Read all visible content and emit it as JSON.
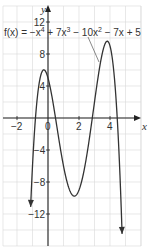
{
  "chart_data": {
    "type": "line",
    "title": "",
    "function_label": "f(x) = −x⁴ + 7x³ − 10x² − 7x + 5",
    "function_label_parts": {
      "fx": "f(x) = −x",
      "e1": "4",
      "p2": " + 7x",
      "e2": "3",
      "p3": " − 10x",
      "e3": "2",
      "p4": " − 7x + 5"
    },
    "xlabel": "x",
    "ylabel": "y",
    "xlim": [
      -3,
      6
    ],
    "ylim": [
      -16,
      14
    ],
    "x_ticks": [
      {
        "v": -2,
        "label": "−2"
      },
      {
        "v": 0,
        "label": "0"
      },
      {
        "v": 2,
        "label": "2"
      },
      {
        "v": 4,
        "label": "4"
      }
    ],
    "y_ticks": [
      {
        "v": 12,
        "label": "12"
      },
      {
        "v": 8,
        "label": "8"
      },
      {
        "v": 4,
        "label": "4"
      },
      {
        "v": -4,
        "label": "−4"
      },
      {
        "v": -8,
        "label": "−8"
      },
      {
        "v": -12,
        "label": "−12"
      }
    ],
    "grid": true,
    "coefficients": [
      -1,
      7,
      -10,
      -7,
      5
    ],
    "series": [
      {
        "name": "f(x)",
        "x": [
          -1.2,
          -0.9,
          -0.6,
          -0.3,
          0,
          0.5,
          1,
          1.5,
          1.8,
          2,
          2.5,
          3,
          3.5,
          3.7,
          4,
          4.5,
          4.8
        ],
        "values": [
          -15.1,
          -2.9,
          3.8,
          6.0,
          5,
          -0.7,
          -6,
          -9.2,
          -9.7,
          -9,
          -4.6,
          2,
          8.1,
          9.4,
          9,
          -1.8,
          -15.0
        ]
      }
    ],
    "extrema": [
      {
        "x": -0.3,
        "y": 6.0,
        "kind": "local max"
      },
      {
        "x": 1.8,
        "y": -9.7,
        "kind": "local min"
      },
      {
        "x": 3.7,
        "y": 9.4,
        "kind": "local max"
      }
    ]
  }
}
